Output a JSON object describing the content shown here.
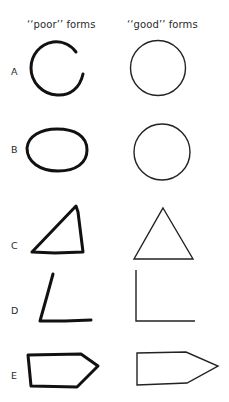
{
  "figure": {
    "columns": [
      {
        "id": "poor",
        "label": "‘‘poor’’ forms"
      },
      {
        "id": "good",
        "label": "‘‘good’’ forms"
      }
    ],
    "rows": [
      {
        "label": "A",
        "shape": "circle",
        "poor": "incomplete circle (gap on right)",
        "good": "complete circle"
      },
      {
        "label": "B",
        "shape": "circle",
        "poor": "flattened ellipse",
        "good": "round circle"
      },
      {
        "label": "C",
        "shape": "triangle",
        "poor": "irregular right-leaning triangle",
        "good": "equilateral triangle"
      },
      {
        "label": "D",
        "shape": "right angle",
        "poor": "slanted L angle",
        "good": "true right angle"
      },
      {
        "label": "E",
        "shape": "pentagon arrow",
        "poor": "irregular arrow pentagon",
        "good": "regular arrow pentagon"
      }
    ]
  },
  "colors": {
    "background": "#ffffff",
    "ink": "#111111"
  }
}
